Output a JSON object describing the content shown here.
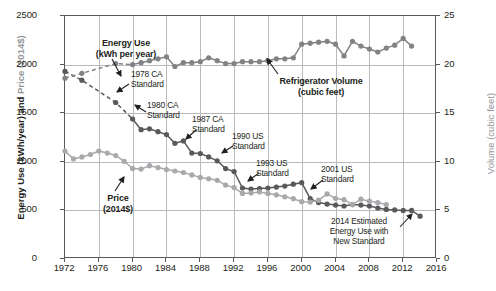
{
  "chart_data": {
    "type": "line",
    "title": "",
    "xlabel": "",
    "ylabel": "Energy Use (kWh/year) and Price (2014$)",
    "ylabel_right": "Volume (cubic feet)",
    "xlim": [
      1972,
      2016
    ],
    "ylim": [
      0,
      2500
    ],
    "ylim_right": [
      0,
      25
    ],
    "xticks": [
      1972,
      1976,
      1980,
      1984,
      1988,
      1992,
      1996,
      2000,
      2004,
      2008,
      2012,
      2016
    ],
    "yticks": [
      0,
      500,
      1000,
      1500,
      2000,
      2500
    ],
    "yticks_right": [
      0,
      5,
      10,
      15,
      20,
      25
    ],
    "grid": true,
    "legend_position": "inline-annotations",
    "series": [
      {
        "name": "Energy Use (kWh per year)",
        "axis": "left",
        "color": "#58595b",
        "style": "dashed-then-solid",
        "x": [
          1972,
          1974,
          1978,
          1980,
          1981,
          1982,
          1983,
          1984,
          1985,
          1986,
          1987,
          1988,
          1989,
          1990,
          1991,
          1992,
          1993,
          1994,
          1995,
          1996,
          1997,
          1998,
          1999,
          2000,
          2001,
          2002,
          2003,
          2004,
          2005,
          2006,
          2007,
          2008,
          2009,
          2010,
          2011,
          2012,
          2013,
          2014
        ],
        "values": [
          1930,
          1840,
          1610,
          1440,
          1330,
          1340,
          1310,
          1280,
          1190,
          1215,
          1090,
          1085,
          1050,
          1010,
          930,
          900,
          730,
          720,
          725,
          730,
          740,
          750,
          770,
          785,
          620,
          580,
          565,
          555,
          545,
          560,
          555,
          545,
          525,
          510,
          505,
          500,
          500,
          440
        ]
      },
      {
        "name": "Price (2014$)",
        "axis": "left",
        "color": "#a7a9ac",
        "style": "solid",
        "x": [
          1972,
          1973,
          1974,
          1975,
          1976,
          1977,
          1978,
          1979,
          1980,
          1981,
          1982,
          1983,
          1984,
          1985,
          1986,
          1987,
          1988,
          1989,
          1990,
          1991,
          1992,
          1993,
          1994,
          1995,
          1996,
          1997,
          1998,
          1999,
          2000,
          2001,
          2002,
          2003,
          2004,
          2005,
          2006,
          2007,
          2008,
          2009,
          2010
        ],
        "values": [
          1110,
          1030,
          1050,
          1075,
          1110,
          1090,
          1065,
          1005,
          930,
          925,
          960,
          940,
          920,
          905,
          890,
          865,
          840,
          825,
          810,
          760,
          735,
          675,
          680,
          690,
          675,
          660,
          640,
          620,
          590,
          585,
          605,
          670,
          625,
          610,
          560,
          615,
          595,
          580,
          560
        ]
      },
      {
        "name": "Refrigerator Volume (cubic feet)",
        "axis": "right",
        "color": "#808285",
        "style": "dashed-then-solid",
        "x": [
          1972,
          1974,
          1978,
          1980,
          1981,
          1982,
          1983,
          1984,
          1985,
          1986,
          1987,
          1988,
          1989,
          1990,
          1991,
          1992,
          1993,
          1994,
          1995,
          1996,
          1997,
          1998,
          1999,
          2000,
          2001,
          2002,
          2003,
          2004,
          2005,
          2006,
          2007,
          2008,
          2009,
          2010,
          2011,
          2012,
          2013
        ],
        "values": [
          18.6,
          19.1,
          20.1,
          20.0,
          20.2,
          20.4,
          20.6,
          20.8,
          19.8,
          20.2,
          20.2,
          20.3,
          20.7,
          20.4,
          20.1,
          20.1,
          20.3,
          20.3,
          20.3,
          20.4,
          20.6,
          20.6,
          20.7,
          22.1,
          22.2,
          22.3,
          22.4,
          22.1,
          20.9,
          22.4,
          21.9,
          21.6,
          21.3,
          21.7,
          22.0,
          22.7,
          21.9
        ]
      }
    ],
    "annotations": [
      {
        "name": "energy-use",
        "text": "Energy Use\n(kWh per year)",
        "bold": true
      },
      {
        "name": "ca-1978",
        "text": "1978 CA\nStandard",
        "bold": false
      },
      {
        "name": "ca-1980",
        "text": "1980 CA\nStandard",
        "bold": false
      },
      {
        "name": "ca-1987",
        "text": "1987 CA\nStandard",
        "bold": false
      },
      {
        "name": "us-1990",
        "text": "1990 US\nStandard",
        "bold": false
      },
      {
        "name": "us-1993",
        "text": "1993 US\nStandard",
        "bold": false
      },
      {
        "name": "us-2001",
        "text": "2001 US\nStandard",
        "bold": false
      },
      {
        "name": "refrigerator-volume",
        "text": "Refrigerator Volume\n(cubic feet)",
        "bold": true
      },
      {
        "name": "price",
        "text": "Price\n(2014$)",
        "bold": true
      },
      {
        "name": "estimate-2014",
        "text": "2014 Estimated\nEnergy Use with\nNew Standard",
        "bold": false
      }
    ]
  },
  "axis": {
    "left_title_main": "Energy Use (kWh/year) ",
    "left_title_bold": "and ",
    "left_title_dim": "Price (2014$)",
    "right_title": "Volume (cubic feet)"
  }
}
